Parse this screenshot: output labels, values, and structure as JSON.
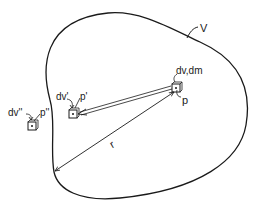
{
  "diagram": {
    "type": "physics-gravitational-potential",
    "region_label": "V",
    "distance_label": "r",
    "elements": [
      {
        "id": "p",
        "volume_label": "dv,dm",
        "point_label": "p",
        "location": "inside"
      },
      {
        "id": "p_prime",
        "volume_label": "dv'",
        "point_label": "p'",
        "location": "inside"
      },
      {
        "id": "p_double_prime",
        "volume_label": "dv''",
        "point_label": "p''",
        "location": "outside"
      }
    ],
    "connections": [
      {
        "from": "p",
        "to": "p_prime",
        "style": "double-line-arrow"
      },
      {
        "from": "p",
        "to": "boundary",
        "style": "double-headed-arrow",
        "label": "r"
      }
    ],
    "colors": {
      "ink": "#1a1a1a",
      "background": "#ffffff"
    }
  }
}
